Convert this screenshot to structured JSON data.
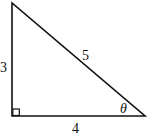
{
  "diagram": {
    "type": "right-triangle",
    "stroke_color": "#111111",
    "vertices": {
      "top": [
        12,
        3
      ],
      "right_angle": [
        12,
        116
      ],
      "right": [
        145,
        116
      ]
    },
    "labels": {
      "vertical_side": "3",
      "hypotenuse": "5",
      "horizontal_side": "4",
      "angle": "θ"
    },
    "right_angle_marker": true
  }
}
